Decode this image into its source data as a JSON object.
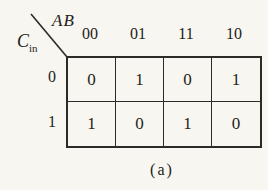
{
  "kmap": {
    "corner": {
      "top_label": "AB",
      "side_label_main": "C",
      "side_label_sub": "in"
    },
    "col_headers": [
      "00",
      "01",
      "11",
      "10"
    ],
    "row_headers": [
      "0",
      "1"
    ],
    "rows": [
      [
        "0",
        "1",
        "0",
        "1"
      ],
      [
        "1",
        "0",
        "1",
        "0"
      ]
    ],
    "caption": "(a)"
  },
  "colors": {
    "background": "#f8f6f1",
    "line": "#2b2a27",
    "text": "#1f1d1a"
  }
}
